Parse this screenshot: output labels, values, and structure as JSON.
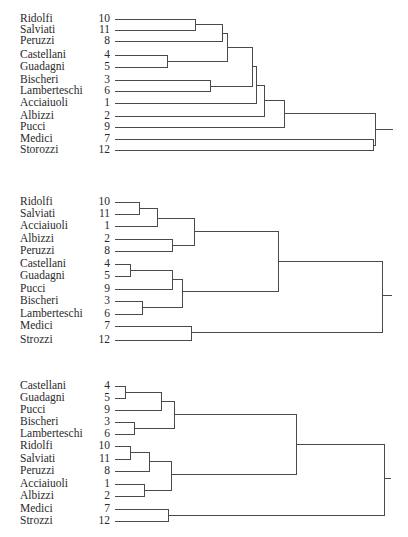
{
  "page": {
    "title_fragment": ""
  },
  "dendrograms": [
    {
      "id": "dendrogram-1",
      "top": 0,
      "height": 170,
      "leaves": [
        {
          "name": "Ridolfi",
          "num": "10",
          "y": 19
        },
        {
          "name": "Salviati",
          "num": "11",
          "y": 30
        },
        {
          "name": "Peruzzi",
          "num": "8",
          "y": 41
        },
        {
          "name": "Castellani",
          "num": "4",
          "y": 55
        },
        {
          "name": "Guadagni",
          "num": "5",
          "y": 67
        },
        {
          "name": "Bischeri",
          "num": "3",
          "y": 80
        },
        {
          "name": "Lamberteschi",
          "num": "6",
          "y": 91
        },
        {
          "name": "Acciaiuoli",
          "num": "1",
          "y": 103
        },
        {
          "name": "Albizzi",
          "num": "2",
          "y": 116
        },
        {
          "name": "Pucci",
          "num": "9",
          "y": 127
        },
        {
          "name": "Medici",
          "num": "7",
          "y": 139
        },
        {
          "name": "Storozzi",
          "num": "12",
          "y": 150
        }
      ],
      "line_start_x": 115,
      "merges": [
        {
          "x": 195,
          "y1": 19,
          "y2": 30,
          "from1_x": 115,
          "from2_x": 115,
          "mid": 24
        },
        {
          "x": 222,
          "y1": 24,
          "y2": 41,
          "from1_x": 195,
          "from2_x": 115,
          "mid": 33
        },
        {
          "x": 167,
          "y1": 55,
          "y2": 67,
          "from1_x": 115,
          "from2_x": 115,
          "mid": 61
        },
        {
          "x": 227,
          "y1": 33,
          "y2": 61,
          "from1_x": 222,
          "from2_x": 167,
          "mid": 47
        },
        {
          "x": 210,
          "y1": 80,
          "y2": 91,
          "from1_x": 115,
          "from2_x": 115,
          "mid": 86
        },
        {
          "x": 252,
          "y1": 47,
          "y2": 86,
          "from1_x": 227,
          "from2_x": 210,
          "mid": 66
        },
        {
          "x": 256,
          "y1": 66,
          "y2": 103,
          "from1_x": 252,
          "from2_x": 115,
          "mid": 85
        },
        {
          "x": 264,
          "y1": 85,
          "y2": 116,
          "from1_x": 256,
          "from2_x": 115,
          "mid": 100
        },
        {
          "x": 284,
          "y1": 100,
          "y2": 127,
          "from1_x": 264,
          "from2_x": 115,
          "mid": 113
        },
        {
          "x": 373,
          "y1": 139,
          "y2": 150,
          "from1_x": 115,
          "from2_x": 115,
          "mid": 145
        },
        {
          "x": 375,
          "y1": 113,
          "y2": 145,
          "from1_x": 284,
          "from2_x": 373,
          "mid": 129
        }
      ],
      "root": {
        "x": 375,
        "y": 129,
        "tail_x": 393
      }
    },
    {
      "id": "dendrogram-2",
      "top": 0,
      "height": 360,
      "leaves": [
        {
          "name": "Ridolfi",
          "num": "10",
          "y": 202
        },
        {
          "name": "Salviati",
          "num": "11",
          "y": 214
        },
        {
          "name": "Acciaiuoli",
          "num": "1",
          "y": 226
        },
        {
          "name": "Albizzi",
          "num": "2",
          "y": 239
        },
        {
          "name": "Peruzzi",
          "num": "8",
          "y": 251
        },
        {
          "name": "Castellani",
          "num": "4",
          "y": 264
        },
        {
          "name": "Guadagni",
          "num": "5",
          "y": 276
        },
        {
          "name": "Pucci",
          "num": "9",
          "y": 289
        },
        {
          "name": "Bischeri",
          "num": "3",
          "y": 301
        },
        {
          "name": "Lamberteschi",
          "num": "6",
          "y": 314
        },
        {
          "name": "Medici",
          "num": "7",
          "y": 326
        },
        {
          "name": "Strozzi",
          "num": "12",
          "y": 340
        }
      ],
      "line_start_x": 115,
      "merges": [
        {
          "x": 139,
          "y1": 202,
          "y2": 214,
          "from1_x": 115,
          "from2_x": 115,
          "mid": 208
        },
        {
          "x": 157,
          "y1": 208,
          "y2": 226,
          "from1_x": 139,
          "from2_x": 115,
          "mid": 218
        },
        {
          "x": 172,
          "y1": 239,
          "y2": 251,
          "from1_x": 115,
          "from2_x": 115,
          "mid": 245
        },
        {
          "x": 194,
          "y1": 218,
          "y2": 245,
          "from1_x": 157,
          "from2_x": 172,
          "mid": 231
        },
        {
          "x": 130,
          "y1": 264,
          "y2": 276,
          "from1_x": 115,
          "from2_x": 115,
          "mid": 270
        },
        {
          "x": 172,
          "y1": 270,
          "y2": 289,
          "from1_x": 130,
          "from2_x": 115,
          "mid": 279
        },
        {
          "x": 142,
          "y1": 301,
          "y2": 314,
          "from1_x": 115,
          "from2_x": 115,
          "mid": 307
        },
        {
          "x": 182,
          "y1": 279,
          "y2": 307,
          "from1_x": 172,
          "from2_x": 142,
          "mid": 291
        },
        {
          "x": 278,
          "y1": 231,
          "y2": 291,
          "from1_x": 194,
          "from2_x": 182,
          "mid": 261
        },
        {
          "x": 191,
          "y1": 326,
          "y2": 340,
          "from1_x": 115,
          "from2_x": 115,
          "mid": 332
        },
        {
          "x": 382,
          "y1": 261,
          "y2": 332,
          "from1_x": 278,
          "from2_x": 191,
          "mid": 295
        }
      ],
      "root": {
        "x": 382,
        "y": 295,
        "tail_x": 392
      }
    },
    {
      "id": "dendrogram-3",
      "top": 0,
      "height": 537,
      "leaves": [
        {
          "name": "Castellani",
          "num": "4",
          "y": 386
        },
        {
          "name": "Guadagni",
          "num": "5",
          "y": 398
        },
        {
          "name": "Pucci",
          "num": "9",
          "y": 410
        },
        {
          "name": "Bischeri",
          "num": "3",
          "y": 422
        },
        {
          "name": "Lamberteschi",
          "num": "6",
          "y": 434
        },
        {
          "name": "Ridolfi",
          "num": "10",
          "y": 446
        },
        {
          "name": "Salviati",
          "num": "11",
          "y": 459
        },
        {
          "name": "Peruzzi",
          "num": "8",
          "y": 471
        },
        {
          "name": "Acciaiuoli",
          "num": "1",
          "y": 484
        },
        {
          "name": "Albizzi",
          "num": "2",
          "y": 496
        },
        {
          "name": "Medici",
          "num": "7",
          "y": 509
        },
        {
          "name": "Strozzi",
          "num": "12",
          "y": 521
        }
      ],
      "line_start_x": 115,
      "merges": [
        {
          "x": 125,
          "y1": 386,
          "y2": 398,
          "from1_x": 115,
          "from2_x": 115,
          "mid": 392
        },
        {
          "x": 161,
          "y1": 392,
          "y2": 410,
          "from1_x": 125,
          "from2_x": 115,
          "mid": 401
        },
        {
          "x": 134,
          "y1": 422,
          "y2": 434,
          "from1_x": 115,
          "from2_x": 115,
          "mid": 428
        },
        {
          "x": 174,
          "y1": 401,
          "y2": 428,
          "from1_x": 161,
          "from2_x": 134,
          "mid": 414
        },
        {
          "x": 130,
          "y1": 446,
          "y2": 459,
          "from1_x": 115,
          "from2_x": 115,
          "mid": 452
        },
        {
          "x": 149,
          "y1": 452,
          "y2": 471,
          "from1_x": 130,
          "from2_x": 115,
          "mid": 461
        },
        {
          "x": 144,
          "y1": 484,
          "y2": 496,
          "from1_x": 115,
          "from2_x": 115,
          "mid": 490
        },
        {
          "x": 171,
          "y1": 461,
          "y2": 490,
          "from1_x": 149,
          "from2_x": 144,
          "mid": 474
        },
        {
          "x": 296,
          "y1": 414,
          "y2": 474,
          "from1_x": 174,
          "from2_x": 171,
          "mid": 444
        },
        {
          "x": 168,
          "y1": 509,
          "y2": 521,
          "from1_x": 115,
          "from2_x": 115,
          "mid": 515
        },
        {
          "x": 384,
          "y1": 444,
          "y2": 515,
          "from1_x": 296,
          "from2_x": 168,
          "mid": 478
        }
      ],
      "root": {
        "x": 384,
        "y": 478,
        "tail_x": 391
      }
    }
  ],
  "chart_data": [
    {
      "type": "dendrogram",
      "title": "",
      "leaf_order": [
        "Ridolfi (10)",
        "Salviati (11)",
        "Peruzzi (8)",
        "Castellani (4)",
        "Guadagni (5)",
        "Bischeri (3)",
        "Lamberteschi (6)",
        "Acciaiuoli (1)",
        "Albizzi (2)",
        "Pucci (9)",
        "Medici (7)",
        "Storozzi (12)"
      ],
      "clusters": "((((((10,11),8),(4,5)),(3,6)),1),2),9),(7,12)"
    },
    {
      "type": "dendrogram",
      "title": "",
      "leaf_order": [
        "Ridolfi (10)",
        "Salviati (11)",
        "Acciaiuoli (1)",
        "Albizzi (2)",
        "Peruzzi (8)",
        "Castellani (4)",
        "Guadagni (5)",
        "Pucci (9)",
        "Bischeri (3)",
        "Lamberteschi (6)",
        "Medici (7)",
        "Strozzi (12)"
      ],
      "clusters": "(((((10,11),1),(2,8)),(((4,5),9),(3,6))),(7,12))"
    },
    {
      "type": "dendrogram",
      "title": "",
      "leaf_order": [
        "Castellani (4)",
        "Guadagni (5)",
        "Pucci (9)",
        "Bischeri (3)",
        "Lamberteschi (6)",
        "Ridolfi (10)",
        "Salviati (11)",
        "Peruzzi (8)",
        "Acciaiuoli (1)",
        "Albizzi (2)",
        "Medici (7)",
        "Strozzi (12)"
      ],
      "clusters": "((((((4,5),9),(3,6)),(((10,11),8),(1,2))),(7,12))"
    }
  ]
}
